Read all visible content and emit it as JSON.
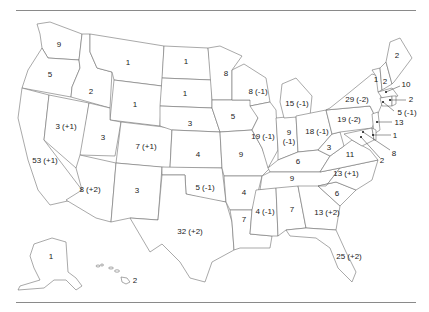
{
  "map": {
    "title": "",
    "description": "U.S. states labeled with number of House seats and change",
    "states": [
      {
        "id": "WA",
        "label": "9",
        "x": 59,
        "y": 45
      },
      {
        "id": "OR",
        "label": "5",
        "x": 50,
        "y": 75
      },
      {
        "id": "CA",
        "label": "53 (+1)",
        "x": 45,
        "y": 161
      },
      {
        "id": "NV",
        "label": "3 (+1)",
        "x": 66,
        "y": 127
      },
      {
        "id": "ID",
        "label": "2",
        "x": 91,
        "y": 92
      },
      {
        "id": "MT",
        "label": "1",
        "x": 128,
        "y": 63
      },
      {
        "id": "WY",
        "label": "1",
        "x": 135,
        "y": 105
      },
      {
        "id": "UT",
        "label": "3",
        "x": 103,
        "y": 138
      },
      {
        "id": "AZ",
        "label": "8 (+2)",
        "x": 90,
        "y": 190
      },
      {
        "id": "CO",
        "label": "7 (+1)",
        "x": 146,
        "y": 147
      },
      {
        "id": "NM",
        "label": "3",
        "x": 137,
        "y": 191
      },
      {
        "id": "ND",
        "label": "1",
        "x": 186,
        "y": 62
      },
      {
        "id": "SD",
        "label": "1",
        "x": 185,
        "y": 94
      },
      {
        "id": "NE",
        "label": "3",
        "x": 190,
        "y": 124
      },
      {
        "id": "KS",
        "label": "4",
        "x": 198,
        "y": 155
      },
      {
        "id": "OK",
        "label": "5 (-1)",
        "x": 205,
        "y": 188
      },
      {
        "id": "TX",
        "label": "32 (+2)",
        "x": 190,
        "y": 232
      },
      {
        "id": "MN",
        "label": "8",
        "x": 226,
        "y": 74
      },
      {
        "id": "IA",
        "label": "5",
        "x": 233,
        "y": 117
      },
      {
        "id": "MO",
        "label": "9",
        "x": 241,
        "y": 155
      },
      {
        "id": "AR",
        "label": "4",
        "x": 244,
        "y": 193
      },
      {
        "id": "LA",
        "label": "7",
        "x": 244,
        "y": 220
      },
      {
        "id": "WI",
        "label": "8 (-1)",
        "x": 258,
        "y": 92
      },
      {
        "id": "IL",
        "label": "19 (-1)",
        "x": 263,
        "y": 137
      },
      {
        "id": "MI",
        "label": "15 (-1)",
        "x": 297,
        "y": 104
      },
      {
        "id": "IN",
        "label": "9",
        "x": 289,
        "y": 133
      },
      {
        "id": "IN2",
        "label": "(-1)",
        "x": 289,
        "y": 142
      },
      {
        "id": "OH",
        "label": "18 (-1)",
        "x": 317,
        "y": 132
      },
      {
        "id": "KY",
        "label": "6",
        "x": 298,
        "y": 162
      },
      {
        "id": "TN",
        "label": "9",
        "x": 292,
        "y": 179
      },
      {
        "id": "MS",
        "label": "4 (-1)",
        "x": 265,
        "y": 212
      },
      {
        "id": "AL",
        "label": "7",
        "x": 292,
        "y": 210
      },
      {
        "id": "GA",
        "label": "13 (+2)",
        "x": 327,
        "y": 213
      },
      {
        "id": "FL",
        "label": "25 (+2)",
        "x": 349,
        "y": 257
      },
      {
        "id": "SC",
        "label": "6",
        "x": 337,
        "y": 194
      },
      {
        "id": "NC",
        "label": "13 (+1)",
        "x": 346,
        "y": 174
      },
      {
        "id": "VA",
        "label": "11",
        "x": 350,
        "y": 155
      },
      {
        "id": "WV",
        "label": "3",
        "x": 329,
        "y": 148
      },
      {
        "id": "PA",
        "label": "19 (-2)",
        "x": 349,
        "y": 120
      },
      {
        "id": "NY",
        "label": "29 (-2)",
        "x": 357,
        "y": 100
      },
      {
        "id": "VT",
        "label": "1",
        "x": 376,
        "y": 80
      },
      {
        "id": "NH",
        "label": "2",
        "x": 385,
        "y": 82
      },
      {
        "id": "ME",
        "label": "2",
        "x": 397,
        "y": 56
      },
      {
        "id": "AK",
        "label": "1",
        "x": 51,
        "y": 257
      },
      {
        "id": "HI",
        "label": "2",
        "x": 133,
        "y": 281
      }
    ],
    "callouts": [
      {
        "id": "MA",
        "label": "10",
        "x": 406,
        "y": 85
      },
      {
        "id": "RI",
        "label": "2",
        "x": 411,
        "y": 100
      },
      {
        "id": "CT",
        "label": "5 (-1)",
        "x": 407,
        "y": 113
      },
      {
        "id": "NJ",
        "label": "13",
        "x": 398,
        "y": 123
      },
      {
        "id": "DE",
        "label": "1",
        "x": 395,
        "y": 136
      },
      {
        "id": "MD",
        "label": "8",
        "x": 394,
        "y": 154
      },
      {
        "id": "DC",
        "label": "2",
        "x": 382,
        "y": 161
      }
    ]
  }
}
